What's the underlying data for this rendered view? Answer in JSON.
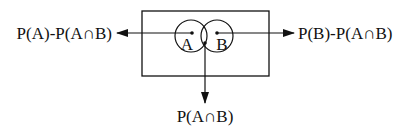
{
  "diagram": {
    "type": "venn",
    "universe": {
      "label": ""
    },
    "sets": [
      {
        "id": "A",
        "label": "A"
      },
      {
        "id": "B",
        "label": "B"
      }
    ],
    "arrows": [
      {
        "from": "A-only",
        "direction": "left",
        "label": "P(A)-P(A∩B)"
      },
      {
        "from": "B-only",
        "direction": "right",
        "label": "P(B)-P(A∩B)"
      },
      {
        "from": "intersection",
        "direction": "down",
        "label": "P(A∩B)"
      }
    ],
    "colors": {
      "stroke": "#111111",
      "background": "#ffffff"
    }
  }
}
